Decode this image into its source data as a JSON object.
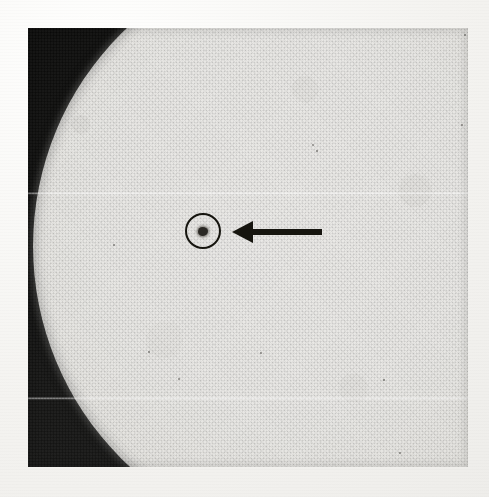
{
  "image": {
    "kind": "halftone-photograph",
    "subject": "solar-disk",
    "caption_text": "",
    "width": 489,
    "height": 497,
    "background_color": "#f6f5f2"
  },
  "photo_plate": {
    "x": 28,
    "y": 28,
    "width": 440,
    "height": 439,
    "sky_color": "#141413",
    "disk_color": "#e2e1dd",
    "ink_color": "#16150f"
  },
  "solar_disk": {
    "center_x": 333,
    "center_y": 246,
    "radius": 300,
    "visible_portion": "left limb at frame edge, disk fills frame to right",
    "limb_darkening": true
  },
  "sunspot": {
    "center_x": 203,
    "center_y": 231,
    "width": 10,
    "height": 9,
    "color": "#2a2824"
  },
  "annotations": {
    "circle_marker": {
      "name": "sunspot-circle-marker",
      "center_x": 203,
      "center_y": 231,
      "radius": 18,
      "stroke_width": 2.4,
      "color": "#16150f"
    },
    "arrow_marker": {
      "name": "sunspot-arrow-marker",
      "direction": "left",
      "tip_x": 232,
      "tail_x": 322,
      "center_y": 232,
      "shaft_thickness": 6,
      "head_width": 21,
      "head_height": 22,
      "color": "#16150f"
    }
  },
  "artifacts": {
    "scan_lines": [
      {
        "y": 192,
        "label": "upper-scan-line"
      },
      {
        "y": 397,
        "label": "lower-scan-line"
      }
    ],
    "specks": [
      {
        "x": 312,
        "y": 144,
        "size": 2.0,
        "tone": "dark"
      },
      {
        "x": 316,
        "y": 150,
        "size": 1.6,
        "tone": "dark"
      },
      {
        "x": 464,
        "y": 34,
        "size": 2.4,
        "tone": "dark"
      },
      {
        "x": 461,
        "y": 124,
        "size": 2.2,
        "tone": "dark"
      },
      {
        "x": 113,
        "y": 244,
        "size": 2.0,
        "tone": "dark"
      },
      {
        "x": 178,
        "y": 378,
        "size": 2.2,
        "tone": "dark"
      },
      {
        "x": 260,
        "y": 352,
        "size": 1.8,
        "tone": "dark"
      },
      {
        "x": 399,
        "y": 452,
        "size": 1.8,
        "tone": "dark"
      },
      {
        "x": 148,
        "y": 351,
        "size": 1.6,
        "tone": "dark"
      },
      {
        "x": 383,
        "y": 379,
        "size": 1.5,
        "tone": "dark"
      }
    ]
  }
}
